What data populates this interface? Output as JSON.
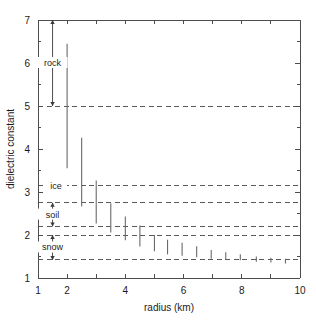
{
  "chart_data": {
    "type": "scatter",
    "title": "",
    "subtitle": "",
    "xlabel": "radius (km)",
    "ylabel": "dielectric constant",
    "xlim": [
      1,
      10
    ],
    "ylim": [
      1,
      7
    ],
    "grid": false,
    "legend_position": "none",
    "x_major_ticks": [
      1,
      2,
      3,
      4,
      5,
      6,
      7,
      8,
      9,
      10
    ],
    "x_tick_labels": [
      "1",
      "2",
      "",
      "4",
      "",
      "6",
      "",
      "8",
      "",
      "10"
    ],
    "y_major_ticks": [
      1,
      2,
      3,
      4,
      5,
      6,
      7
    ],
    "y_tick_labels": [
      "1",
      "2",
      "3",
      "4",
      "5",
      "6",
      "7"
    ],
    "y_minor_ticks": [
      1.5,
      2.5,
      3.5,
      4.5,
      5.5,
      6.5
    ],
    "reference_lines": [
      {
        "name": "rock-ice-boundary",
        "value": 5.0,
        "style": "dashed"
      },
      {
        "name": "ice-line",
        "value": 3.15,
        "style": "dashed"
      },
      {
        "name": "soil-upper",
        "value": 2.75,
        "style": "dashed"
      },
      {
        "name": "soil-lower",
        "value": 2.2,
        "style": "dashed"
      },
      {
        "name": "snow-upper",
        "value": 2.0,
        "style": "dashed"
      },
      {
        "name": "snow-lower",
        "value": 1.42,
        "style": "dashed"
      }
    ],
    "annotations": [
      {
        "label": "rock",
        "x": 1.5,
        "y_top": 7.0,
        "y_bottom": 5.0,
        "arrow": "double"
      },
      {
        "label": "ice",
        "x": 1.62,
        "y": 3.15,
        "arrow": "none"
      },
      {
        "label": "soil",
        "x": 1.5,
        "y_top": 2.75,
        "y_bottom": 2.2,
        "arrow": "double"
      },
      {
        "label": "snow",
        "x": 1.5,
        "y_top": 2.0,
        "y_bottom": 1.42,
        "arrow": "double"
      }
    ],
    "series": [
      {
        "name": "dielectric constant range",
        "style": "vertical error bars",
        "points": [
          {
            "x": 2.0,
            "low": 3.55,
            "high": 6.45
          },
          {
            "x": 2.5,
            "low": 2.66,
            "high": 4.26
          },
          {
            "x": 3.0,
            "low": 2.27,
            "high": 3.27
          },
          {
            "x": 3.5,
            "low": 2.06,
            "high": 2.74
          },
          {
            "x": 4.0,
            "low": 1.88,
            "high": 2.43
          },
          {
            "x": 4.5,
            "low": 1.73,
            "high": 2.22
          },
          {
            "x": 5.0,
            "low": 1.62,
            "high": 2.0
          },
          {
            "x": 5.45,
            "low": 1.55,
            "high": 1.89
          },
          {
            "x": 5.95,
            "low": 1.52,
            "high": 1.82
          },
          {
            "x": 6.45,
            "low": 1.48,
            "high": 1.74
          },
          {
            "x": 6.95,
            "low": 1.45,
            "high": 1.65
          },
          {
            "x": 7.45,
            "low": 1.43,
            "high": 1.6
          },
          {
            "x": 7.95,
            "low": 1.41,
            "high": 1.55
          },
          {
            "x": 8.5,
            "low": 1.38,
            "high": 1.5
          },
          {
            "x": 9.0,
            "low": 1.36,
            "high": 1.47
          },
          {
            "x": 9.5,
            "low": 1.34,
            "high": 1.45
          }
        ]
      }
    ]
  },
  "figure": {
    "y_axis_title": "dielectric constant",
    "x_axis_title": "radius (km)"
  },
  "colors": {
    "axis": "#4d4d4d",
    "reference_line": "#5a5a5a",
    "data": "#6a6a6a",
    "text": "#1a1a1a",
    "background": "#ffffff"
  }
}
